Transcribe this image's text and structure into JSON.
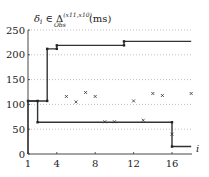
{
  "chart_data": {
    "type": "line",
    "title_parts": {
      "main": "δ",
      "sub_i": "i",
      "in": " ∈ Δ",
      "sup": "(x11,x10)",
      "sub_obs": "Obs",
      "unit": " (ms)"
    },
    "xlabel": "i",
    "ylabel": "δ_i (ms)",
    "xlim": [
      1,
      18
    ],
    "ylim": [
      0,
      250
    ],
    "x_ticks": [
      1,
      4,
      8,
      12,
      16
    ],
    "y_ticks": [
      0,
      50,
      100,
      150,
      200,
      250
    ],
    "grid": "horizontal-dotted",
    "series": [
      {
        "name": "upper bound",
        "style": "step",
        "points": [
          [
            1,
            0
          ],
          [
            1,
            107
          ],
          [
            3,
            107
          ],
          [
            3,
            212
          ],
          [
            4,
            212
          ],
          [
            4,
            219
          ],
          [
            11,
            219
          ],
          [
            11,
            227
          ],
          [
            18,
            227
          ]
        ]
      },
      {
        "name": "lower bound",
        "style": "step",
        "points": [
          [
            1,
            107
          ],
          [
            2,
            107
          ],
          [
            2,
            64
          ],
          [
            16,
            64
          ],
          [
            16,
            15
          ],
          [
            18,
            15
          ]
        ]
      },
      {
        "name": "observed delays",
        "style": "scatter",
        "marker": "x",
        "x": [
          5,
          6,
          7,
          8,
          9,
          10,
          12,
          13,
          14,
          15,
          16,
          18
        ],
        "y": [
          116,
          105,
          124,
          116,
          65,
          65,
          107,
          68,
          122,
          118,
          40,
          122
        ]
      }
    ]
  }
}
